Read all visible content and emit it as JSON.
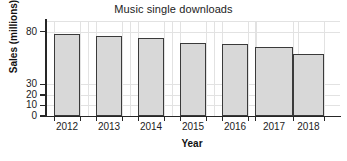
{
  "chart_data": {
    "type": "bar",
    "title": "Music single downloads",
    "xlabel": "Year",
    "ylabel": "Sales (millions)",
    "categories": [
      "2012",
      "2013",
      "2014",
      "2015",
      "2016",
      "2017",
      "2018"
    ],
    "values": [
      78,
      76,
      74,
      69,
      68,
      65,
      59
    ],
    "yticks": [
      "0",
      "10",
      "20",
      "30",
      "80"
    ],
    "ytick_values": [
      0,
      10,
      20,
      30,
      80
    ],
    "ylim": [
      0,
      90
    ],
    "grid": true,
    "legend": "none",
    "bar_fill_color": "#d8d8d8",
    "bar_edge_color": "#3a3a3a",
    "grid_color": "#e2e2e2",
    "axis_color": "#262626"
  }
}
